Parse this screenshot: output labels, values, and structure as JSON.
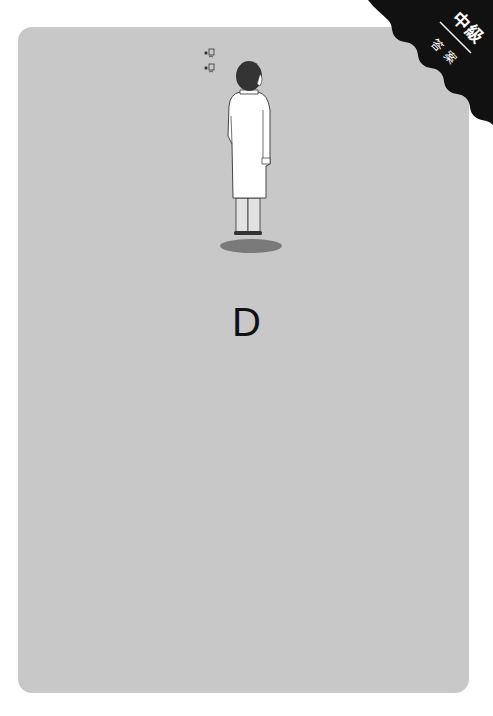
{
  "badge": {
    "level": "中級",
    "sub": "答案"
  },
  "illustration": {
    "subject": "doctor-in-white-coat-back-view",
    "sound_marks": [
      "呵~",
      "呵~"
    ]
  },
  "answer": {
    "label": "D"
  },
  "colors": {
    "card_bg": "#c8c8c8",
    "badge_bg": "#111111",
    "coat": "#ffffff",
    "shadow": "#7a7a7a",
    "text": "#111111"
  }
}
